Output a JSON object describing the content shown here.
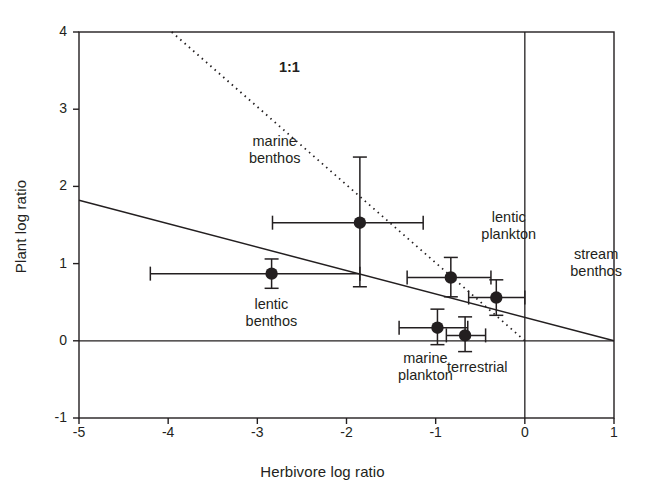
{
  "chart_data": {
    "type": "scatter",
    "title": "",
    "xlabel": "Herbivore log ratio",
    "ylabel": "Plant log ratio",
    "xlim": [
      -5,
      1
    ],
    "ylim": [
      -1,
      4
    ],
    "xticks": [
      -5,
      -4,
      -3,
      -2,
      -1,
      0,
      1
    ],
    "xtick_labels": [
      "-5",
      "-4",
      "-3",
      "-2",
      "-1",
      "0",
      "1"
    ],
    "yticks": [
      -1,
      0,
      1,
      2,
      3,
      4
    ],
    "ytick_labels": [
      "-1",
      "0",
      "1",
      "2",
      "3",
      "4"
    ],
    "grid": false,
    "legend": "none",
    "points": [
      {
        "label": "lentic benthos",
        "label_lines": [
          "lentic",
          "benthos"
        ],
        "x": -2.84,
        "y": 0.87,
        "xerr_low": -4.2,
        "xerr_high": -1.85,
        "yerr_low": 0.68,
        "yerr_high": 1.06,
        "label_pos": "below"
      },
      {
        "label": "marine benthos",
        "label_lines": [
          "marine",
          "benthos"
        ],
        "x": -1.85,
        "y": 1.53,
        "xerr_low": -2.83,
        "xerr_high": -1.14,
        "yerr_low": 0.7,
        "yerr_high": 2.38,
        "label_pos": "above-left"
      },
      {
        "label": "lentic plankton",
        "label_lines": [
          "lentic",
          "plankton"
        ],
        "x": -0.83,
        "y": 0.82,
        "xerr_low": -1.32,
        "xerr_high": -0.38,
        "yerr_low": 0.57,
        "yerr_high": 1.08,
        "label_pos": "right"
      },
      {
        "label": "stream benthos",
        "label_lines": [
          "stream",
          "benthos"
        ],
        "x": -0.32,
        "y": 0.56,
        "xerr_low": -0.63,
        "xerr_high": 0.0,
        "yerr_low": 0.33,
        "yerr_high": 0.79,
        "label_pos": "right-outside"
      },
      {
        "label": "marine plankton",
        "label_lines": [
          "marine",
          "plankton"
        ],
        "x": -0.98,
        "y": 0.17,
        "xerr_low": -1.41,
        "xerr_high": -0.64,
        "yerr_low": -0.05,
        "yerr_high": 0.41,
        "label_pos": "below"
      },
      {
        "label": "terrestrial",
        "label_lines": [
          "terrestrial"
        ],
        "x": -0.67,
        "y": 0.07,
        "xerr_low": -0.88,
        "xerr_high": -0.44,
        "yerr_low": -0.14,
        "yerr_high": 0.31,
        "label_pos": "below"
      }
    ],
    "lines": [
      {
        "name": "one-to-one",
        "label": "1:1",
        "style": "dotted",
        "from": [
          -3.96,
          4.0
        ],
        "to": [
          0.0,
          0.0
        ],
        "label_x": -2.64,
        "label_y": 3.55
      },
      {
        "name": "regression",
        "label": "",
        "style": "solid",
        "from": [
          -5.0,
          1.82
        ],
        "to": [
          1.0,
          0.0
        ]
      }
    ],
    "reference_lines": [
      {
        "name": "zero-horizontal",
        "orientation": "horizontal",
        "value": 0
      },
      {
        "name": "zero-vertical",
        "orientation": "vertical",
        "value": 0
      }
    ]
  }
}
